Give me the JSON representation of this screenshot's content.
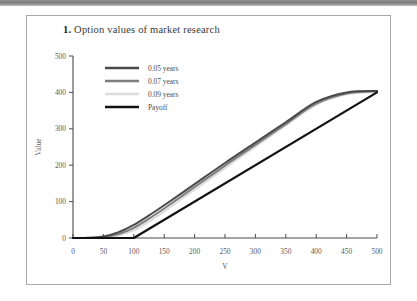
{
  "figure": {
    "number": "1.",
    "title": "Option values of market research"
  },
  "chart_data": {
    "type": "line",
    "title": "1. Option values of market research",
    "xlabel": "V",
    "ylabel": "Value",
    "xlim": [
      0,
      500
    ],
    "ylim": [
      0,
      500
    ],
    "xticks": [
      0,
      50,
      100,
      150,
      200,
      250,
      300,
      350,
      400,
      450,
      500
    ],
    "yticks": [
      0,
      100,
      200,
      300,
      400,
      500
    ],
    "grid": false,
    "legend_position": "upper left",
    "strike": 100,
    "series": [
      {
        "name": "0.05 years",
        "color": "#4a4a4a",
        "width": 2.0,
        "x": [
          0,
          25,
          50,
          75,
          100,
          125,
          150,
          200,
          250,
          300,
          350,
          400,
          450,
          500
        ],
        "values": [
          0,
          0.6,
          4.0,
          16.0,
          36.0,
          62.0,
          90.0,
          148.0,
          206.0,
          262.0,
          318.0,
          374.0,
          400.0,
          404.0
        ]
      },
      {
        "name": "0.07 years",
        "color": "#7d7d7d",
        "width": 2.0,
        "x": [
          0,
          25,
          50,
          75,
          100,
          125,
          150,
          200,
          250,
          300,
          350,
          400,
          450,
          500
        ],
        "values": [
          0,
          0.3,
          2.4,
          11.0,
          28.0,
          53.0,
          81.0,
          140.0,
          199.0,
          256.0,
          313.0,
          369.0,
          397.0,
          403.0
        ]
      },
      {
        "name": "0.09 years",
        "color": "#dcdcdc",
        "width": 2.0,
        "x": [
          0,
          25,
          50,
          75,
          100,
          125,
          150,
          200,
          250,
          300,
          350,
          400,
          450,
          500
        ],
        "values": [
          0,
          0.1,
          1.2,
          7.0,
          21.0,
          45.0,
          73.0,
          133.0,
          192.0,
          251.0,
          309.0,
          366.0,
          395.0,
          402.0
        ]
      },
      {
        "name": "Payoff",
        "color": "#111111",
        "width": 2.2,
        "x": [
          0,
          100,
          500
        ],
        "values": [
          0,
          0,
          400
        ]
      }
    ]
  },
  "legend": {
    "entries": [
      {
        "label": "0.05 years",
        "color": "#4a4a4a"
      },
      {
        "label": "0.07 years",
        "color": "#7d7d7d"
      },
      {
        "label": "0.09 years",
        "color": "#dcdcdc"
      },
      {
        "label": "Payoff",
        "color": "#111111"
      }
    ]
  }
}
